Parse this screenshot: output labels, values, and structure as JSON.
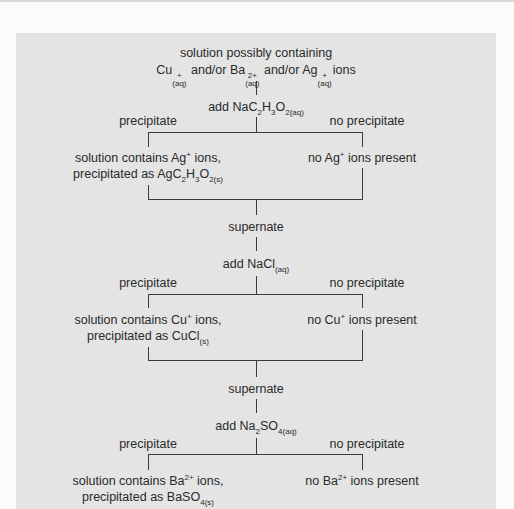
{
  "diagram": {
    "start": {
      "line1": "solution possibly containing",
      "line2_parts": [
        {
          "base": "Cu",
          "sup": "+",
          "sub": "(aq)"
        },
        {
          "text": " and/or "
        },
        {
          "base": "Ba",
          "sup": "2+",
          "sub": "(aq)"
        },
        {
          "text": " and/or "
        },
        {
          "base": "Ag",
          "sup": "+",
          "sub": "(aq)"
        },
        {
          "text": " ions"
        }
      ]
    },
    "steps": [
      {
        "reagent_prefix": "add NaC",
        "reagent_display": "add NaC₂H₃O₂(aq)",
        "branch_left": "precipitate",
        "branch_right": "no precipitate",
        "left_result_line1": "solution contains Ag⁺ ions,",
        "left_result_line2": "precipitated as AgC₂H₃O₂(s)",
        "right_result": "no Ag⁺ ions present",
        "next": "supernate"
      },
      {
        "reagent_display": "add NaCl(aq)",
        "branch_left": "precipitate",
        "branch_right": "no precipitate",
        "left_result_line1": "solution contains Cu⁺ ions,",
        "left_result_line2": "precipitated as CuCl(s)",
        "right_result": "no Cu⁺ ions present",
        "next": "supernate"
      },
      {
        "reagent_display": "add Na₂SO₄(aq)",
        "branch_left": "precipitate",
        "branch_right": "no precipitate",
        "left_result_line1": "solution contains Ba²⁺ ions,",
        "left_result_line2": "precipitated as BaSO₄(s)",
        "right_result": "no Ba²⁺ ions present"
      }
    ],
    "text": {
      "and_or": "and/or",
      "ions": "ions",
      "cu": "Cu",
      "ba": "Ba",
      "ag": "Ag",
      "plus": "+",
      "two_plus": "2+",
      "aq": "(aq)",
      "s": "(s)",
      "add": "add",
      "na": "Na",
      "c": "C",
      "h": "H",
      "o": "O",
      "cl": "Cl",
      "so": "SO",
      "two": "2",
      "three": "3",
      "four": "4",
      "s1_left_l1_pre": "solution contains Ag",
      "s1_left_l1_post": " ions,",
      "s1_left_l2_pre": "precipitated as Ag",
      "s1_right_pre": "no Ag",
      "s1_right_post": " ions present",
      "s2_left_l1_pre": "solution contains Cu",
      "s2_left_l2_pre": "precipitated as CuCl",
      "s2_right_pre": "no Cu",
      "s3_left_l1_pre": "solution contains Ba",
      "s3_left_l2_pre": "precipitated as BaSO",
      "s3_right_pre": "no Ba",
      "ions_comma": " ions,",
      "ions_present": " ions present"
    },
    "colors": {
      "panel_bg": "#e4e4e4",
      "page_bg": "#fbfbfb",
      "line": "#3a3a3a",
      "text": "#2a2a2a"
    }
  }
}
